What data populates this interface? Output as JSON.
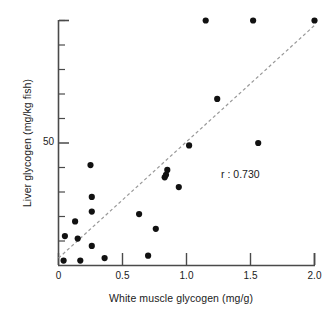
{
  "chart_data": {
    "type": "scatter",
    "title": "",
    "xlabel": "White muscle glycogen (mg/g)",
    "ylabel": "Liver glycogen (mg/kg fish)",
    "xlim": [
      0,
      2.0
    ],
    "ylim": [
      0,
      100
    ],
    "grid": false,
    "legend": "none",
    "xticks": [
      0,
      0.5,
      1.0,
      1.5,
      2.0
    ],
    "xtick_labels": [
      "0",
      "0.5",
      "1.0",
      "1.5",
      "2.0"
    ],
    "yticks": [
      10,
      20,
      30,
      40,
      50,
      60,
      70,
      80,
      90,
      100
    ],
    "ytick_labels": [
      "",
      "",
      "",
      "",
      "50",
      "",
      "",
      "",
      "",
      ""
    ],
    "ytick_labeled_value": 50,
    "marker": "filled-circle",
    "marker_color": "#111111",
    "marker_size_px": 5,
    "points": [
      {
        "x": 0.04,
        "y": 2
      },
      {
        "x": 0.05,
        "y": 12
      },
      {
        "x": 0.13,
        "y": 18
      },
      {
        "x": 0.15,
        "y": 11
      },
      {
        "x": 0.17,
        "y": 2
      },
      {
        "x": 0.25,
        "y": 41
      },
      {
        "x": 0.26,
        "y": 28
      },
      {
        "x": 0.26,
        "y": 22
      },
      {
        "x": 0.26,
        "y": 8
      },
      {
        "x": 0.36,
        "y": 3
      },
      {
        "x": 0.63,
        "y": 21
      },
      {
        "x": 0.7,
        "y": 4
      },
      {
        "x": 0.76,
        "y": 15
      },
      {
        "x": 0.83,
        "y": 36
      },
      {
        "x": 0.84,
        "y": 37
      },
      {
        "x": 0.85,
        "y": 39
      },
      {
        "x": 0.94,
        "y": 32
      },
      {
        "x": 1.02,
        "y": 49
      },
      {
        "x": 1.15,
        "y": 100
      },
      {
        "x": 1.24,
        "y": 68
      },
      {
        "x": 1.52,
        "y": 100
      },
      {
        "x": 1.56,
        "y": 50
      },
      {
        "x": 2.0,
        "y": 100
      }
    ],
    "trendline": {
      "style": "dashed",
      "color": "#999999",
      "x_start": 0.0,
      "y_start": 3,
      "x_end": 2.0,
      "y_end": 98
    },
    "annotations": [
      {
        "text": "r : 0.730",
        "x": 1.52,
        "y": 37
      }
    ],
    "correlation_label": "r : 0.730",
    "spines": [
      "left",
      "bottom"
    ]
  }
}
